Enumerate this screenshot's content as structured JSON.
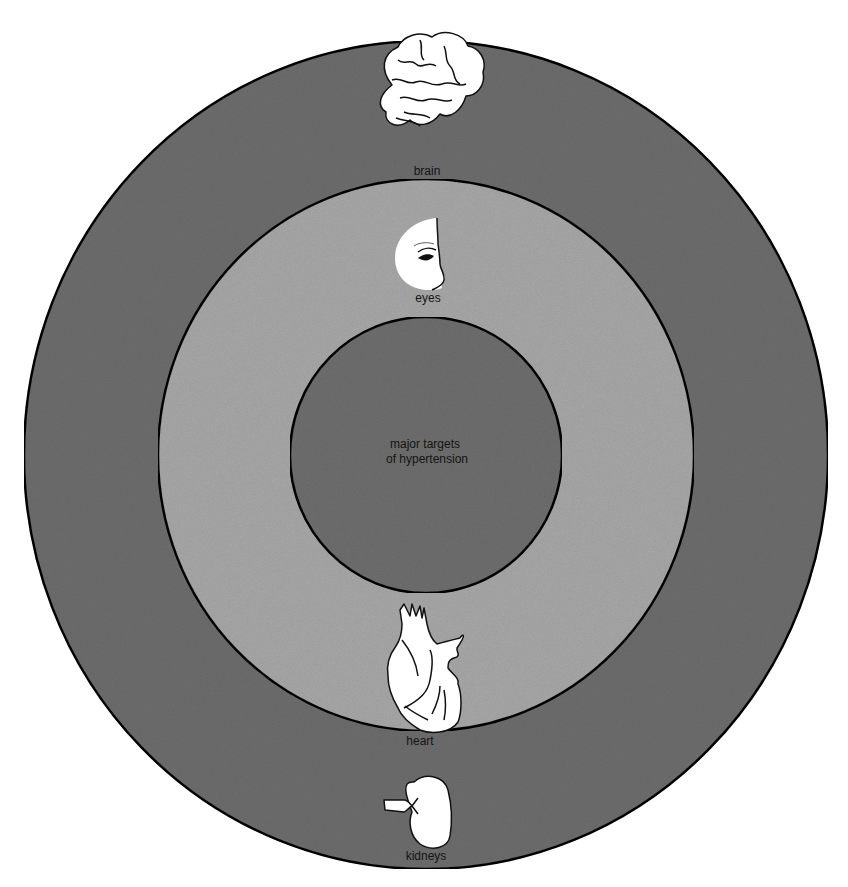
{
  "title": "major targets of hypertension",
  "center_label": [
    "major targets",
    "of hypertension"
  ],
  "colors": {
    "outer_ring": "#6e6e6e",
    "middle_ring": "#a9a9a9",
    "inner_circle": "#707070",
    "outline": "#111111",
    "organ_fill": "#ffffff",
    "background": "#ffffff"
  },
  "rings": [
    {
      "name": "outer",
      "organs": [
        "brain",
        "kidneys"
      ]
    },
    {
      "name": "middle",
      "organs": [
        "eyes",
        "heart"
      ]
    },
    {
      "name": "inner",
      "organs": []
    }
  ],
  "organs": {
    "brain": {
      "label": "brain",
      "icon": "brain-icon"
    },
    "eyes": {
      "label": "eyes",
      "icon": "eye-face-icon"
    },
    "heart": {
      "label": "heart",
      "icon": "heart-icon"
    },
    "kidneys": {
      "label": "kidneys",
      "icon": "kidney-icon"
    }
  }
}
